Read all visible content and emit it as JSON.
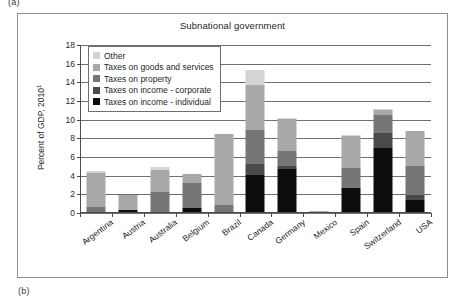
{
  "figure": {
    "panel_tag_top": "(a)",
    "panel_tag_bottom": "(b)"
  },
  "chart_data": {
    "type": "bar",
    "subtype": "stacked-bar",
    "title": "Subnational government",
    "xlabel": "",
    "ylabel": "Percent of GDP, 2010",
    "ylabel_superscript": "1",
    "ylim": [
      0,
      18
    ],
    "ytick_step": 2,
    "ytick_labels": [
      "0",
      "2",
      "4",
      "6",
      "8",
      "10",
      "12",
      "14",
      "16",
      "18"
    ],
    "grid": true,
    "legend_position": "upper-left inside plot",
    "categories": [
      "Argentina",
      "Austria",
      "Australia",
      "Belgium",
      "Brazil",
      "Canada",
      "Germany",
      "Mexico",
      "Spain",
      "Switzerland",
      "USA"
    ],
    "series": [
      {
        "name": "Taxes on income - individual",
        "color": "#0d0d0d",
        "values": [
          0.0,
          0.3,
          0.0,
          0.55,
          0.0,
          4.1,
          4.7,
          0.0,
          2.7,
          7.0,
          1.4
        ]
      },
      {
        "name": "Taxes on income - corporate",
        "color": "#4a4a4a",
        "values": [
          0.0,
          0.0,
          0.0,
          0.0,
          0.0,
          1.2,
          0.3,
          0.0,
          0.0,
          1.6,
          0.5
        ]
      },
      {
        "name": "Taxes on property",
        "color": "#767676",
        "values": [
          0.65,
          0.0,
          2.3,
          2.65,
          0.85,
          3.6,
          1.6,
          0.05,
          2.1,
          1.9,
          3.1
        ]
      },
      {
        "name": "Taxes on goods and services",
        "color": "#a8a8a8",
        "values": [
          3.65,
          1.6,
          2.3,
          1.0,
          7.65,
          4.8,
          3.5,
          0.2,
          3.5,
          0.5,
          3.8
        ]
      },
      {
        "name": "Other",
        "color": "#d4d4d4",
        "values": [
          0.15,
          0.05,
          0.3,
          0.0,
          0.0,
          1.6,
          0.1,
          0.0,
          0.1,
          0.2,
          0.0
        ]
      }
    ],
    "totals": [
      4.45,
      1.95,
      4.9,
      4.2,
      8.5,
      15.3,
      10.2,
      0.25,
      8.4,
      11.2,
      8.8
    ]
  }
}
